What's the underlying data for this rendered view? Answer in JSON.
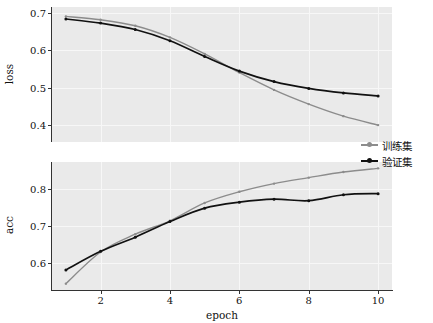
{
  "chart_data": [
    {
      "id": "loss",
      "type": "line",
      "title": "",
      "xlabel": "",
      "ylabel": "loss",
      "x": [
        1,
        2,
        3,
        4,
        5,
        6,
        7,
        8,
        9,
        10
      ],
      "xlim": [
        0.6,
        10.4
      ],
      "ylim": [
        0.355,
        0.715
      ],
      "xticks": [
        2,
        4,
        6,
        8,
        10
      ],
      "xticklabels": [
        "2",
        "4",
        "6",
        "8",
        "10"
      ],
      "yticks": [
        0.4,
        0.5,
        0.6,
        0.7
      ],
      "yticklabels": [
        "0.4",
        "0.5",
        "0.6",
        "0.7"
      ],
      "grid": true,
      "legend_position": "right-middle",
      "series": [
        {
          "name": "训练集",
          "color": "#8c8c8c",
          "marker": "dot",
          "values": [
            0.69,
            0.681,
            0.665,
            0.634,
            0.59,
            0.54,
            0.494,
            0.456,
            0.424,
            0.4
          ]
        },
        {
          "name": "验证集",
          "color": "#111111",
          "marker": "dot",
          "values": [
            0.683,
            0.672,
            0.655,
            0.625,
            0.583,
            0.544,
            0.516,
            0.498,
            0.486,
            0.478
          ]
        }
      ]
    },
    {
      "id": "acc",
      "type": "line",
      "title": "",
      "xlabel": "epoch",
      "ylabel": "acc",
      "x": [
        1,
        2,
        3,
        4,
        5,
        6,
        7,
        8,
        9,
        10
      ],
      "xlim": [
        0.6,
        10.4
      ],
      "ylim": [
        0.528,
        0.872
      ],
      "xticks": [
        2,
        4,
        6,
        8,
        10
      ],
      "xticklabels": [
        "2",
        "4",
        "6",
        "8",
        "10"
      ],
      "yticks": [
        0.6,
        0.7,
        0.8
      ],
      "yticklabels": [
        "0.6",
        "0.7",
        "0.8"
      ],
      "grid": true,
      "legend_position": "right-middle",
      "series": [
        {
          "name": "训练集",
          "color": "#8c8c8c",
          "marker": "dot",
          "values": [
            0.545,
            0.63,
            0.678,
            0.714,
            0.762,
            0.792,
            0.814,
            0.83,
            0.845,
            0.855
          ]
        },
        {
          "name": "验证集",
          "color": "#111111",
          "marker": "dot",
          "values": [
            0.582,
            0.632,
            0.67,
            0.712,
            0.748,
            0.764,
            0.772,
            0.768,
            0.784,
            0.787
          ]
        }
      ]
    }
  ],
  "legend": {
    "items": [
      {
        "label": "训练集",
        "color": "#8c8c8c"
      },
      {
        "label": "验证集",
        "color": "#111111"
      }
    ]
  },
  "axes": {
    "loss": {
      "ylabel": "loss",
      "yticklabels": [
        "0.7",
        "0.6",
        "0.5",
        "0.4"
      ]
    },
    "acc": {
      "ylabel": "acc",
      "yticklabels": [
        "0.8",
        "0.7",
        "0.6"
      ]
    },
    "xlabel": "epoch",
    "xticklabels": [
      "2",
      "4",
      "6",
      "8",
      "10"
    ]
  },
  "style": {
    "panel_background": "#eaeaea",
    "grid_color": "#f7f7f7",
    "axis_color": "#333333",
    "figure_background": "#ffffff"
  }
}
